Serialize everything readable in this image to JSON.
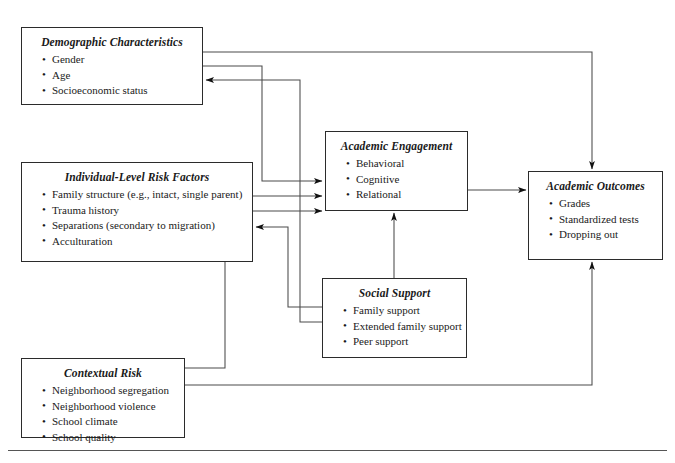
{
  "diagram": {
    "type": "conceptual-model-flow-diagram",
    "nodes": [
      {
        "id": "demographic",
        "title": "Demographic Characteristics",
        "items": [
          "Gender",
          "Age",
          "Socioeconomic status"
        ]
      },
      {
        "id": "individual",
        "title": "Individual-Level Risk Factors",
        "items": [
          "Family structure (e.g., intact, single parent)",
          "Trauma history",
          "Separations (secondary to migration)",
          "Acculturation"
        ]
      },
      {
        "id": "contextual",
        "title": "Contextual Risk",
        "items": [
          "Neighborhood segregation",
          "Neighborhood violence",
          "School climate",
          "School quality"
        ]
      },
      {
        "id": "engagement",
        "title": "Academic Engagement",
        "items": [
          "Behavioral",
          "Cognitive",
          "Relational"
        ]
      },
      {
        "id": "support",
        "title": "Social Support",
        "items": [
          "Family support",
          "Extended family support",
          "Peer support"
        ]
      },
      {
        "id": "outcomes",
        "title": "Academic Outcomes",
        "items": [
          "Grades",
          "Standardized tests",
          "Dropping out"
        ]
      }
    ],
    "edges": [
      {
        "from": "demographic",
        "to": "outcomes",
        "style": "orthogonal",
        "arrow": "end"
      },
      {
        "from": "demographic",
        "to": "engagement",
        "style": "orthogonal",
        "arrow": "end"
      },
      {
        "from": "support",
        "to": "demographic",
        "style": "orthogonal",
        "arrow": "end"
      },
      {
        "from": "individual",
        "to": "engagement",
        "style": "straight",
        "arrow": "end"
      },
      {
        "from": "support",
        "to": "individual",
        "style": "orthogonal",
        "arrow": "end"
      },
      {
        "from": "contextual",
        "to": "engagement",
        "style": "orthogonal",
        "arrow": "end"
      },
      {
        "from": "contextual",
        "to": "outcomes",
        "style": "orthogonal",
        "arrow": "end"
      },
      {
        "from": "support",
        "to": "engagement",
        "style": "orthogonal",
        "arrow": "end"
      },
      {
        "from": "engagement",
        "to": "outcomes",
        "style": "straight",
        "arrow": "end"
      }
    ],
    "colors": {
      "box_border": "#2b2b2b",
      "connector": "#444444",
      "background": "#ffffff",
      "text": "#1a1a1a"
    }
  }
}
